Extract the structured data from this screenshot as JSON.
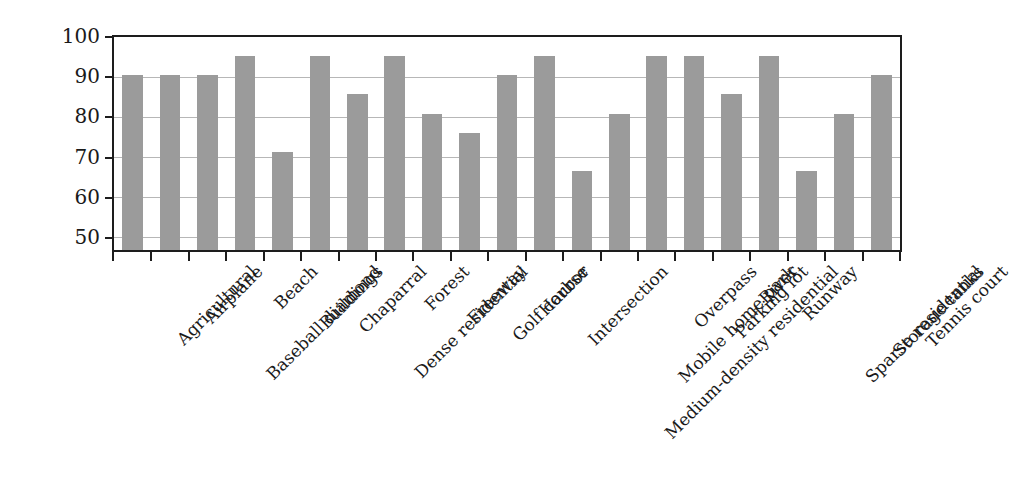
{
  "chart_data": {
    "type": "bar",
    "title": "",
    "xlabel": "",
    "ylabel": "Accuracy (%)",
    "ylim": [
      47,
      100
    ],
    "yticks": [
      50,
      60,
      70,
      80,
      90,
      100
    ],
    "ytick_labels": [
      "50",
      "60",
      "70",
      "80",
      "90",
      "100"
    ],
    "grid": true,
    "legend": "none",
    "bar_color": "#9b9b9b",
    "axis_color": "#1d1d1d",
    "grid_color": "#b7b7b7",
    "categories": [
      "Agricultural",
      "Airplane",
      "Baseball diamond",
      "Beach",
      "Buildings",
      "Chaparral",
      "Dense residential",
      "Forest",
      "Freeway",
      "Golf course",
      "Harbor",
      "Intersection",
      "Medium-density residential",
      "Mobile home park",
      "Overpass",
      "Parking lot",
      "River",
      "Runway",
      "Sparse residential",
      "Storage tanks",
      "Tennis court"
    ],
    "values": [
      90.5,
      90.5,
      90.5,
      95.2,
      71.4,
      95.2,
      85.7,
      95.2,
      80.9,
      76.1,
      90.5,
      95.2,
      66.6,
      80.9,
      95.2,
      95.2,
      85.7,
      95.2,
      66.6,
      80.9,
      90.5
    ]
  }
}
